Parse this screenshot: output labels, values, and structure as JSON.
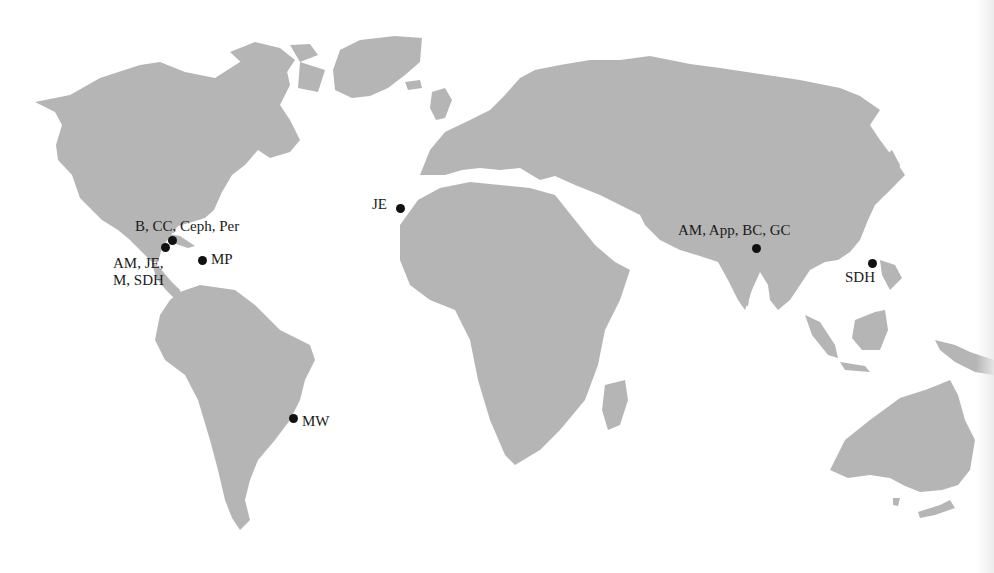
{
  "map": {
    "type": "world map",
    "land_color": "#b5b5b5",
    "ocean_color": "#ffffff",
    "marker_color": "#111111",
    "continents": [
      "north-america",
      "greenland",
      "south-america",
      "europe-asia",
      "africa",
      "madagascar",
      "indonesia",
      "new-guinea",
      "australia",
      "uk",
      "iceland",
      "japan",
      "sri-lanka",
      "new-zealand-ish"
    ]
  },
  "markers": [
    {
      "id": "caribbean-north",
      "label": "B, CC, Ceph, Per",
      "x": 172,
      "y": 240
    },
    {
      "id": "central-america",
      "label": "AM, JE,",
      "label2": "M, SDH",
      "x": 165,
      "y": 247
    },
    {
      "id": "lesser-antilles",
      "label": "MP",
      "x": 202,
      "y": 260
    },
    {
      "id": "canary-islands",
      "label": "JE",
      "x": 400,
      "y": 208
    },
    {
      "id": "brazil",
      "label": "MW",
      "x": 293,
      "y": 418
    },
    {
      "id": "india",
      "label": "AM, App, BC, GC",
      "x": 756,
      "y": 248
    },
    {
      "id": "philippines",
      "label": "SDH",
      "x": 872,
      "y": 263
    }
  ]
}
